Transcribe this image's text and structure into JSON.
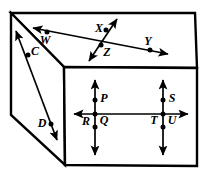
{
  "figure": {
    "type": "geometry-diagram",
    "width": 207,
    "height": 173,
    "stroke_color": "#000000",
    "fill_color": "#ffffff",
    "background": "#ffffff",
    "solid": {
      "name": "rectangular-prism",
      "top_face": "back-top-face",
      "front_face": "front-rectangular-face",
      "left_face": "left-side-face"
    },
    "labels": {
      "W": "W",
      "X": "X",
      "Y": "Y",
      "Z": "Z",
      "C": "C",
      "D": "D",
      "P": "P",
      "Q": "Q",
      "R": "R",
      "S": "S",
      "T": "T",
      "U": "U"
    },
    "points": [
      {
        "id": "W",
        "label": "W",
        "x": 47,
        "y": 32,
        "label_x": 45,
        "label_y": 41,
        "face": "top"
      },
      {
        "id": "X",
        "label": "X",
        "x": 106,
        "y": 30,
        "label_x": 99,
        "label_y": 29,
        "face": "top"
      },
      {
        "id": "Y",
        "label": "Y",
        "x": 150,
        "y": 50,
        "label_x": 148,
        "label_y": 42,
        "face": "top"
      },
      {
        "id": "Z",
        "label": "Z",
        "x": 101,
        "y": 46,
        "label_x": 106,
        "label_y": 52,
        "face": "top"
      },
      {
        "id": "C",
        "label": "C",
        "x": 28,
        "y": 55,
        "label_x": 34,
        "label_y": 52,
        "face": "left"
      },
      {
        "id": "D",
        "label": "D",
        "x": 51,
        "y": 124,
        "label_x": 42,
        "label_y": 124,
        "face": "left"
      },
      {
        "id": "P",
        "label": "P",
        "x": 95,
        "y": 100,
        "label_x": 104,
        "label_y": 99,
        "face": "front"
      },
      {
        "id": "Q",
        "label": "Q",
        "x": 95,
        "y": 114,
        "label_x": 104,
        "label_y": 121,
        "face": "front"
      },
      {
        "id": "R",
        "label": "R",
        "x": 95,
        "y": 127,
        "label_x": 86,
        "label_y": 122,
        "face": "front"
      },
      {
        "id": "S",
        "label": "S",
        "x": 163,
        "y": 100,
        "label_x": 172,
        "label_y": 99,
        "face": "front"
      },
      {
        "id": "T",
        "label": "T",
        "x": 163,
        "y": 114,
        "label_x": 154,
        "label_y": 121,
        "face": "front"
      },
      {
        "id": "U",
        "label": "U",
        "x": 163,
        "y": 127,
        "label_x": 172,
        "label_y": 121,
        "face": "front"
      }
    ],
    "lines": [
      {
        "id": "line-WY",
        "name": "line-through-W-Z-Y",
        "contains": [
          "W",
          "Z",
          "Y"
        ],
        "x1": 33,
        "y1": 28,
        "x2": 168,
        "y2": 54,
        "arrow_start": true,
        "arrow_end": true
      },
      {
        "id": "line-XZ",
        "name": "line-through-X-Z",
        "contains": [
          "X",
          "Z"
        ],
        "x1": 117,
        "y1": 19,
        "x2": 89,
        "y2": 61,
        "arrow_start": true,
        "arrow_end": true
      },
      {
        "id": "line-CD",
        "name": "line-through-C-D",
        "contains": [
          "C",
          "D"
        ],
        "x1": 16,
        "y1": 31,
        "x2": 57,
        "y2": 140,
        "arrow_start": true,
        "arrow_end": true
      },
      {
        "id": "line-horizontal-front",
        "name": "horizontal-line-through-Q-T",
        "contains": [
          "Q",
          "T"
        ],
        "x1": 72,
        "y1": 114,
        "x2": 190,
        "y2": 114,
        "arrow_start": true,
        "arrow_end": true
      },
      {
        "id": "line-vertical-left",
        "name": "vertical-line-through-P-Q-R",
        "contains": [
          "P",
          "Q",
          "R"
        ],
        "x1": 95,
        "y1": 78,
        "x2": 95,
        "y2": 156,
        "arrow_start": true,
        "arrow_end": true
      },
      {
        "id": "line-vertical-right",
        "name": "vertical-line-through-S-T-U",
        "contains": [
          "S",
          "T",
          "U"
        ],
        "x1": 163,
        "y1": 78,
        "x2": 163,
        "y2": 156,
        "arrow_start": true,
        "arrow_end": true
      }
    ]
  }
}
